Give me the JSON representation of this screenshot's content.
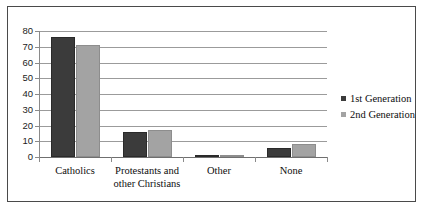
{
  "chart_data": {
    "type": "bar",
    "title": "",
    "xlabel": "",
    "ylabel": "",
    "ylim": [
      0,
      80
    ],
    "yticks": [
      0,
      10,
      20,
      30,
      40,
      50,
      60,
      70,
      80
    ],
    "ytick_labels": [
      "0",
      "10",
      "20",
      "30",
      "40",
      "50",
      "60",
      "70",
      "80"
    ],
    "grid": true,
    "legend_position": "right",
    "categories": [
      "Catholics",
      "Protestants and other Christians",
      "Other",
      "None"
    ],
    "category_labels": [
      [
        "Catholics"
      ],
      [
        "Protestants and",
        "other Christians"
      ],
      [
        "Other"
      ],
      [
        "None"
      ]
    ],
    "series": [
      {
        "name": "1st Generation",
        "color": "#3b3b3b",
        "values": [
          76,
          16,
          1,
          6
        ]
      },
      {
        "name": "2nd Generation",
        "color": "#a3a3a3",
        "values": [
          71,
          17,
          1,
          8
        ]
      }
    ]
  },
  "legend": {
    "items": [
      {
        "label": "1st Generation",
        "color": "#3b3b3b"
      },
      {
        "label": "2nd Generation",
        "color": "#a3a3a3"
      }
    ]
  }
}
